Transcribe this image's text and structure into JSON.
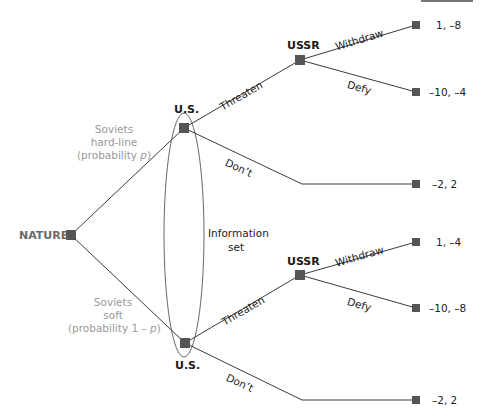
{
  "figure": {
    "colors": {
      "edge": "#3a3a3a",
      "node": "#555555",
      "probability_text": "#999999",
      "nature_text": "#6a6a6a"
    }
  },
  "nodes": {
    "nature": {
      "label": "NATURE"
    },
    "us_top": {
      "label": "U.S."
    },
    "us_bottom": {
      "label": "U.S."
    },
    "ussr_top": {
      "label": "USSR"
    },
    "ussr_bottom": {
      "label": "USSR"
    }
  },
  "nature_branches": {
    "hard": {
      "line1": "Soviets",
      "line2": "hard-line",
      "line3_prefix": "(probability ",
      "line3_var": "p",
      "line3_suffix": ")"
    },
    "soft": {
      "line1": "Soviets",
      "line2": "soft",
      "line3_prefix": "(probability 1 – ",
      "line3_var": "p",
      "line3_suffix": ")"
    }
  },
  "actions": {
    "us_top_threaten": "Threaten",
    "us_top_dont": "Don’t",
    "us_bottom_threaten": "Threaten",
    "us_bottom_dont": "Don’t",
    "ussr_top_withdraw": "Withdraw",
    "ussr_top_defy": "Defy",
    "ussr_bottom_withdraw": "Withdraw",
    "ussr_bottom_defy": "Defy"
  },
  "info_set": {
    "line1": "Information",
    "line2": "set"
  },
  "payoffs": {
    "hard_threaten_withdraw": "1, –8",
    "hard_threaten_defy": "–10, –4",
    "hard_dont": "–2, 2",
    "soft_threaten_withdraw": "1, –4",
    "soft_threaten_defy": "–10, –8",
    "soft_dont": "–2, 2"
  }
}
